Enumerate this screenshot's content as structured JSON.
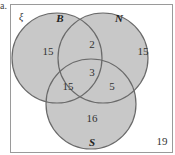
{
  "part_label": "a.",
  "universal_symbol": "ξ",
  "sets": [
    {
      "name": "B"
    },
    {
      "name": "N"
    },
    {
      "name": "S"
    }
  ],
  "regions": {
    "B_only": "15",
    "N_only": "15",
    "S_only": "16",
    "B_and_N_only": "2",
    "B_and_S_only": "15",
    "N_and_S_only": "5",
    "B_and_N_and_S": "3",
    "outside": "19"
  },
  "colors": {
    "fill": "#c8c8c8",
    "stroke": "#6a6a6a",
    "frame": "#9a9a9a"
  }
}
